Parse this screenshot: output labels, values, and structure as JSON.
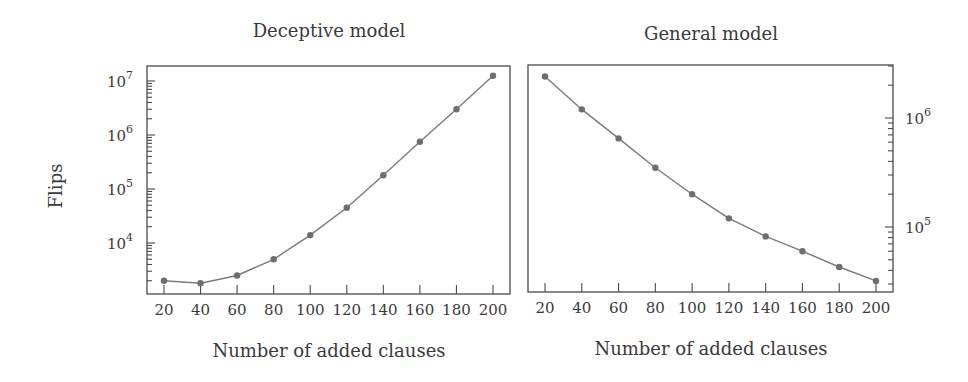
{
  "chart_data": [
    {
      "type": "line",
      "title": "Deceptive model",
      "xlabel": "Number of added clauses",
      "ylabel": "Flips",
      "yscale": "log",
      "x": [
        20,
        40,
        60,
        80,
        100,
        120,
        140,
        160,
        180,
        200
      ],
      "series": [
        {
          "name": "Deceptive model",
          "values": [
            2000,
            1800,
            2500,
            5000,
            14000,
            45000,
            180000,
            750000,
            3000000,
            12500000
          ]
        }
      ],
      "xticks": [
        "20",
        "40",
        "60",
        "80",
        "100",
        "120",
        "140",
        "160",
        "180",
        "200"
      ],
      "yticks": [
        {
          "base": "10",
          "exp": "4",
          "value": 10000
        },
        {
          "base": "10",
          "exp": "5",
          "value": 100000
        },
        {
          "base": "10",
          "exp": "6",
          "value": 1000000
        },
        {
          "base": "10",
          "exp": "7",
          "value": 10000000
        }
      ],
      "yaxis_side": "left",
      "grid": false,
      "legend": "none"
    },
    {
      "type": "line",
      "title": "General model",
      "xlabel": "Number of added clauses",
      "ylabel": "",
      "yscale": "log",
      "x": [
        20,
        40,
        60,
        80,
        100,
        120,
        140,
        160,
        180,
        200
      ],
      "series": [
        {
          "name": "General model",
          "values": [
            2400000,
            1200000,
            650000,
            350000,
            200000,
            120000,
            82000,
            60000,
            43000,
            32000
          ]
        }
      ],
      "xticks": [
        "20",
        "40",
        "60",
        "80",
        "100",
        "120",
        "140",
        "160",
        "180",
        "200"
      ],
      "yticks": [
        {
          "base": "10",
          "exp": "5",
          "value": 100000
        },
        {
          "base": "10",
          "exp": "6",
          "value": 1000000
        }
      ],
      "yaxis_side": "right",
      "grid": false,
      "legend": "none"
    }
  ]
}
